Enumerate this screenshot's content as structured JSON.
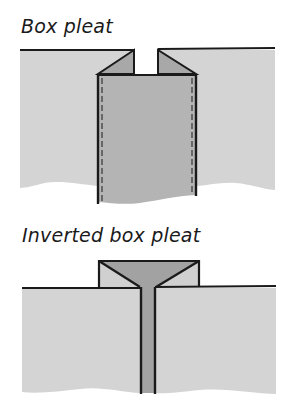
{
  "figures": [
    {
      "title": "Box pleat",
      "colors": {
        "fabric": "#d4d4d4",
        "pleat_face": "#b4b4b4",
        "fold_inner": "#a8a8a8",
        "outline": "#1a1a1a"
      }
    },
    {
      "title": "Inverted box pleat",
      "colors": {
        "fabric": "#d4d4d4",
        "fold_flap": "#d0d0d0",
        "inner_fold": "#a2a2a2",
        "outline": "#1a1a1a"
      }
    }
  ]
}
